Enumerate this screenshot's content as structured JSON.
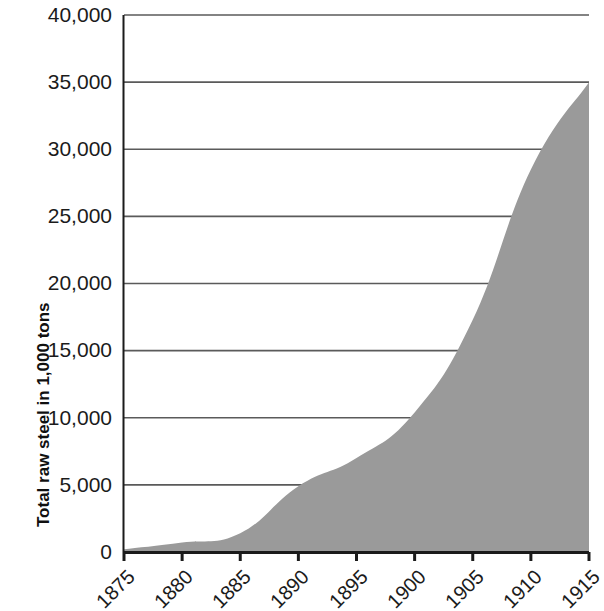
{
  "chart_data": {
    "type": "area",
    "title": "",
    "xlabel": "",
    "ylabel": "Total raw steel in 1,000 tons",
    "x": [
      1875,
      1880,
      1885,
      1890,
      1895,
      1900,
      1905,
      1910,
      1915
    ],
    "values": [
      200,
      700,
      1400,
      4900,
      7000,
      10400,
      17300,
      28500,
      35000
    ],
    "series": [
      {
        "name": "Total raw steel",
        "values": [
          200,
          700,
          1400,
          4900,
          7000,
          10400,
          17300,
          28500,
          35000
        ]
      }
    ],
    "xlim": [
      1875,
      1915
    ],
    "ylim": [
      0,
      40000
    ],
    "ytick_labels": [
      "40,000",
      "35,000",
      "30,000",
      "25,000",
      "20,000",
      "15,000",
      "10,000",
      "5,000",
      "0"
    ],
    "ytick_values": [
      40000,
      35000,
      30000,
      25000,
      20000,
      15000,
      10000,
      5000,
      0
    ],
    "xtick_labels": [
      "1875",
      "1880",
      "1885",
      "1890",
      "1895",
      "1900",
      "1905",
      "1910",
      "1915"
    ],
    "grid": "horizontal",
    "legend": "none",
    "colors": {
      "area_fill": "#9a9a9a",
      "gridline": "#5a5a5a",
      "axis": "#1b1b1b",
      "text": "#1b1b1b"
    }
  }
}
